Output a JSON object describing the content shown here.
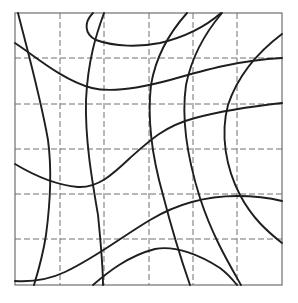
{
  "diagram": {
    "type": "curvilinear-grid",
    "frame": {
      "x0": 15,
      "y0": 13,
      "x1": 282,
      "y1": 285
    },
    "grid": {
      "style": "dashed",
      "vertical_x": [
        60,
        104,
        149,
        193,
        237
      ],
      "horizontal_y": [
        58,
        104,
        149,
        194,
        239
      ],
      "columns": 6,
      "rows": 6
    },
    "colors": {
      "curve": "#1e1e1e",
      "grid": "#707070",
      "frame": "#6e6e6e",
      "background": "#ffffff"
    },
    "curves": [
      {
        "id": "left-vertical",
        "d": "M18,13 C26,45 40,95 48,140 C52,170 50,205 46,235 C43,255 38,272 34,285"
      },
      {
        "id": "upper-sweep",
        "d": "M15,43 C35,56 62,80 92,88 C112,93 140,88 170,80 C205,70 240,60 282,58"
      },
      {
        "id": "top-loop",
        "d": "M93,13 C84,22 84,34 96,40 C115,47 140,47 160,43 C185,37 205,27 221,13"
      },
      {
        "id": "second-vertical",
        "d": "M104,13 C96,35 88,60 86,100 C85,140 92,180 98,215 C101,245 103,265 103,285"
      },
      {
        "id": "mid-wave",
        "d": "M15,164 C35,176 55,185 78,187 C98,188 112,175 130,158 C150,140 165,126 195,118 C225,110 255,106 282,103"
      },
      {
        "id": "lower-s",
        "d": "M15,281 C30,282 48,280 65,272 C95,258 120,238 150,220 C175,205 205,196 237,196 C255,196 270,198 282,201"
      },
      {
        "id": "bottom-right-arc",
        "d": "M93,285 C108,272 128,256 155,249 C175,245 200,255 220,268 C228,274 233,280 237,285"
      },
      {
        "id": "center-right-vertical",
        "d": "M187,13 C170,32 156,55 151,85 C147,120 153,160 163,195 C172,230 182,262 190,285"
      },
      {
        "id": "right-vertical",
        "d": "M222,13 C205,33 192,55 186,85 C181,120 188,160 200,198 C212,235 228,262 241,285"
      },
      {
        "id": "far-right-arc",
        "d": "M282,34 C258,52 238,75 228,105 C220,135 226,168 240,195 C252,218 268,232 282,243"
      }
    ]
  }
}
